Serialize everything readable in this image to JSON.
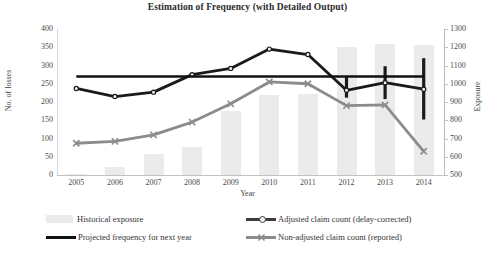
{
  "chart_data": {
    "type": "bar",
    "title": "Estimation of Frequency (with Detailed Output)",
    "xlabel": "Year",
    "ylabel": "No. of losses",
    "y2label": "Exposure",
    "categories": [
      "2005",
      "2006",
      "2007",
      "2008",
      "2009",
      "2010",
      "2011",
      "2012",
      "2013",
      "2014"
    ],
    "ylim": [
      0,
      400
    ],
    "y2lim": [
      500,
      1300
    ],
    "yticks": [
      0,
      50,
      100,
      150,
      200,
      250,
      300,
      350,
      400
    ],
    "y2ticks": [
      500,
      600,
      700,
      800,
      900,
      1000,
      1100,
      1200,
      1300
    ],
    "grid": false,
    "legend_position": "bottom",
    "series": [
      {
        "name": "Historical exposure",
        "type": "bar",
        "axis": "right",
        "color": "#ebebeb",
        "values_left_scale": [
          3,
          22,
          57,
          78,
          175,
          220,
          222,
          350,
          360,
          355
        ],
        "values": [
          506,
          544,
          614,
          656,
          850,
          940,
          944,
          1200,
          1220,
          1210
        ]
      },
      {
        "name": "Adjusted claim count (delay-corrected)",
        "type": "line",
        "axis": "left",
        "color": "#1a1a1a",
        "marker": "dot",
        "values": [
          237,
          215,
          227,
          275,
          292,
          345,
          330,
          232,
          253,
          235
        ],
        "error_bars": [
          {
            "category": "2012",
            "low": 212,
            "high": 268
          },
          {
            "category": "2013",
            "low": 208,
            "high": 298
          },
          {
            "category": "2014",
            "low": 152,
            "high": 320
          }
        ]
      },
      {
        "name": "Non-adjusted claim count (reported)",
        "type": "line",
        "axis": "left",
        "color": "#8c8c8c",
        "marker": "x",
        "values": [
          87,
          92,
          110,
          145,
          195,
          255,
          250,
          190,
          192,
          65
        ]
      },
      {
        "name": "Projected frequency for next year",
        "type": "line",
        "axis": "left",
        "color": "#111111",
        "marker": "none",
        "constant": 270,
        "values": [
          270,
          270,
          270,
          270,
          270,
          270,
          270,
          270,
          270,
          270
        ]
      }
    ],
    "legend": [
      {
        "label": "Historical exposure",
        "marker": "box",
        "color": "#ebebeb"
      },
      {
        "label": "Adjusted claim count (delay-corrected)",
        "marker": "line-dot",
        "color": "#3d3d3d"
      },
      {
        "label": "Projected frequency for next year",
        "marker": "line",
        "color": "#111111"
      },
      {
        "label": "Non-adjusted claim count (reported)",
        "marker": "line-x",
        "color": "#8c8c8c"
      }
    ]
  }
}
